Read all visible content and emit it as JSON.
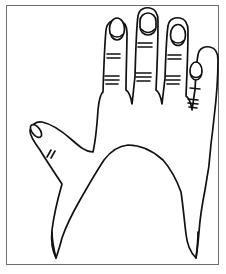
{
  "figure": {
    "title": "Line drawing of an open right hand, palm down, inside a rectangular frame",
    "style": "black-ink-outline-on-white",
    "background_color": "#ffffff",
    "stroke_color": "#111111",
    "frame": {
      "visible": true,
      "color": "#6e6e6e",
      "x": 6,
      "y": 5,
      "width": 213,
      "height": 260,
      "stroke_width": 1
    },
    "canvas": {
      "width": 226,
      "height": 274
    }
  },
  "hand": {
    "orientation": "palm-down-dorsal-view",
    "digit_count": 5,
    "outline_path": "M 30 131 C 31 125 36 121 42 122 C 52 124 62 131 72 140 C 80 147 86 152 93 152 C 96 139 97 125 98 110 C 99 100 100 94 103 92 C 104 60 105 40 106 30 C 107 22 113 19 118 20 C 124 21 127 26 127 33 C 127 48 126 72 126 90 C 129 92 131 97 132 104 C 133 96 134 86 135 76 C 136 40 137 22 138 16 C 139 9 145 7 150 8 C 156 9 158 14 158 21 C 158 36 157 70 156 90 C 159 92 161 97 162 104 C 163 96 164 86 165 78 C 166 48 167 32 168 26 C 169 19 175 17 180 18 C 186 19 188 24 188 31 C 188 46 187 74 186 96 C 189 98 191 103 192 110 C 193 104 194 96 195 90 C 196 70 197 60 198 55 C 199 48 205 46 210 47 C 216 48 218 53 218 60 C 218 75 216 102 214 118 C 213 128 212 136 211 144 C 210 160 208 175 205 190 C 202 205 200 218 199 232 C 198 244 197 252 196 258 C 190 252 187 244 186 234 C 184 218 183 205 181 192 C 176 178 170 168 163 160 C 152 150 140 145 128 145 C 118 146 110 152 104 160 C 96 172 88 186 80 200 C 72 214 66 226 62 238 C 60 246 58 252 56 258 C 52 250 51 240 52 230 C 54 214 58 198 62 184 C 54 172 46 160 40 150 C 34 142 30 136 30 131 Z",
    "fingers": [
      {
        "name": "index-finger",
        "index": 0,
        "nail": {
          "cx": 117,
          "cy": 29,
          "rx": 7.5,
          "ry": 11
        },
        "creases": [
          {
            "group": "upper",
            "lines": 2,
            "y": 56,
            "x1": 107,
            "x2": 120
          },
          {
            "group": "lower",
            "lines": 3,
            "y": 80,
            "x1": 105,
            "x2": 119
          }
        ]
      },
      {
        "name": "middle-finger",
        "index": 1,
        "nail": {
          "cx": 148,
          "cy": 24,
          "rx": 8,
          "ry": 11.5
        },
        "creases": [
          {
            "group": "upper",
            "lines": 2,
            "y": 45,
            "x1": 138,
            "x2": 152
          },
          {
            "group": "lower",
            "lines": 3,
            "y": 77,
            "x1": 136,
            "x2": 151
          }
        ]
      },
      {
        "name": "ring-finger",
        "index": 2,
        "nail": {
          "cx": 178,
          "cy": 35,
          "rx": 7.5,
          "ry": 10.5
        },
        "creases": [
          {
            "group": "upper",
            "lines": 2,
            "y": 57,
            "x1": 168,
            "x2": 181
          },
          {
            "group": "lower",
            "lines": 3,
            "y": 80,
            "x1": 166,
            "x2": 180
          }
        ]
      },
      {
        "name": "little-finger",
        "index": 3,
        "nail": {
          "cx": 196,
          "cy": 71,
          "rx": 6,
          "ry": 9
        },
        "creases": [
          {
            "group": "upper",
            "lines": 1,
            "y": 88,
            "x1": 190,
            "x2": 200
          },
          {
            "group": "lower",
            "lines": 3,
            "y": 102,
            "x1": 188,
            "x2": 198
          }
        ]
      },
      {
        "name": "thumb",
        "index": 4,
        "nail": {
          "cx": 36,
          "cy": 131,
          "rx": 4,
          "ry": 7,
          "rotation": -38
        },
        "creases": [
          {
            "group": "knuckle",
            "lines": 2,
            "y": 155,
            "x1": 47,
            "x2": 56
          }
        ]
      }
    ],
    "wrist_lines": [
      {
        "name": "wrist-left-edge",
        "path": "M 52 232 C 52 240 54 250 56 258"
      },
      {
        "name": "wrist-right-edge",
        "path": "M 198 232 C 198 242 197 250 196 258"
      }
    ]
  }
}
